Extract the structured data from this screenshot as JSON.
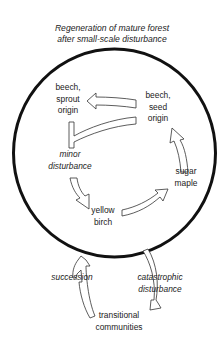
{
  "title": {
    "line1": "Regeneration of mature forest",
    "line2": "after small-scale disturbance"
  },
  "cycle": {
    "nodes": [
      {
        "id": "beech-sprout",
        "lines": [
          "beech,",
          "sprout",
          "origin"
        ]
      },
      {
        "id": "beech-seed",
        "lines": [
          "beech,",
          "seed",
          "origin"
        ]
      },
      {
        "id": "sugar-maple",
        "lines": [
          "sugar",
          "maple"
        ]
      },
      {
        "id": "yellow-birch",
        "lines": [
          "yellow",
          "birch"
        ]
      }
    ],
    "process_labels": {
      "minor_disturbance": [
        "minor",
        "disturbance"
      ]
    }
  },
  "outer": {
    "succession": "succession",
    "catastrophic": [
      "catastrophic",
      "disturbance"
    ],
    "transitional": [
      "transitional",
      "communities"
    ]
  },
  "colors": {
    "circle": "#111111",
    "arrow_stroke": "#333333",
    "arrow_fill": "#ffffff",
    "text": "#222222"
  }
}
